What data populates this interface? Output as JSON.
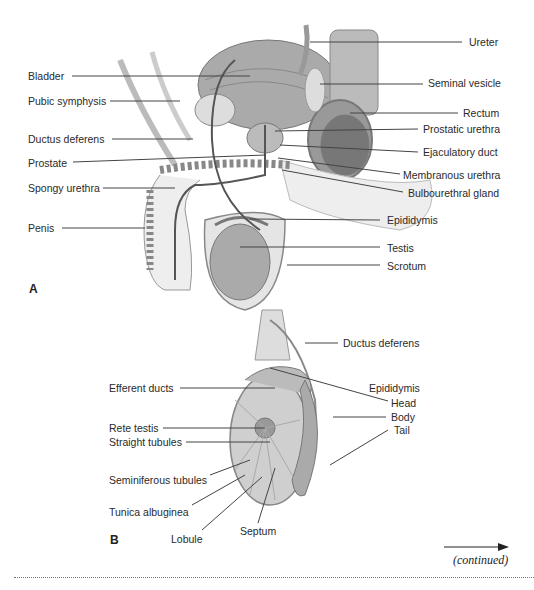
{
  "figure_a": {
    "panel_label": "A",
    "labels_left": [
      {
        "text": "Bladder",
        "x": 28,
        "y": 70
      },
      {
        "text": "Pubic symphysis",
        "x": 28,
        "y": 95
      },
      {
        "text": "Ductus deferens",
        "x": 28,
        "y": 133
      },
      {
        "text": "Prostate",
        "x": 28,
        "y": 157
      },
      {
        "text": "Spongy urethra",
        "x": 28,
        "y": 182
      },
      {
        "text": "Penis",
        "x": 28,
        "y": 222
      }
    ],
    "labels_right": [
      {
        "text": "Ureter",
        "x": 469,
        "y": 36
      },
      {
        "text": "Seminal vesicle",
        "x": 428,
        "y": 77
      },
      {
        "text": "Rectum",
        "x": 463,
        "y": 107
      },
      {
        "text": "Prostatic urethra",
        "x": 423,
        "y": 123
      },
      {
        "text": "Ejaculatory duct",
        "x": 423,
        "y": 146
      },
      {
        "text": "Membranous urethra",
        "x": 403,
        "y": 169
      },
      {
        "text": "Bulbourethral gland",
        "x": 408,
        "y": 187
      },
      {
        "text": "Epididymis",
        "x": 387,
        "y": 214
      },
      {
        "text": "Testis",
        "x": 387,
        "y": 242
      },
      {
        "text": "Scrotum",
        "x": 387,
        "y": 260
      }
    ]
  },
  "figure_b": {
    "panel_label": "B",
    "labels": [
      {
        "text": "Ductus deferens",
        "x": 343,
        "y": 337
      },
      {
        "text": "Efferent ducts",
        "x": 109,
        "y": 382
      },
      {
        "text": "Epididymis",
        "x": 369,
        "y": 382
      },
      {
        "text": "Head",
        "x": 391,
        "y": 397
      },
      {
        "text": "Body",
        "x": 391,
        "y": 411
      },
      {
        "text": "Tail",
        "x": 394,
        "y": 424
      },
      {
        "text": "Rete testis",
        "x": 109,
        "y": 422
      },
      {
        "text": "Straight tubules",
        "x": 109,
        "y": 436
      },
      {
        "text": "Seminiferous tubules",
        "x": 109,
        "y": 474
      },
      {
        "text": "Tunica albuginea",
        "x": 109,
        "y": 506
      },
      {
        "text": "Lobule",
        "x": 171,
        "y": 533
      },
      {
        "text": "Septum",
        "x": 240,
        "y": 525
      }
    ]
  },
  "footer": {
    "continued": "(continued)",
    "arrow": "right-arrow"
  }
}
